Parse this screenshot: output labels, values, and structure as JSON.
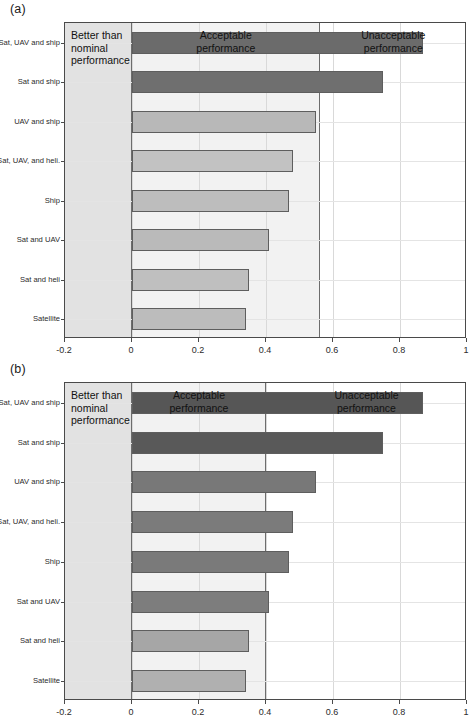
{
  "figure": {
    "panel_a_tag": "(a)",
    "panel_b_tag": "(b)"
  },
  "chart_data": [
    {
      "id": "a",
      "type": "bar",
      "orientation": "horizontal",
      "title": "",
      "xlabel": "",
      "ylabel": "",
      "xlim": [
        -0.2,
        1.0
      ],
      "ylim": [
        0,
        8
      ],
      "grid": true,
      "legend": null,
      "xticks": [
        "-0.2",
        "0",
        "0.2",
        "0.4",
        "0.6",
        "0.8",
        "1"
      ],
      "xtick_values": [
        -0.2,
        0,
        0.2,
        0.4,
        0.6,
        0.8,
        1
      ],
      "categories": [
        "Sat, UAV and ship",
        "Sat and ship",
        "UAV and ship",
        "Sat, UAV, and heli.",
        "Ship",
        "Sat and UAV",
        "Sat and heli",
        "Satellite"
      ],
      "values": [
        0.87,
        0.75,
        0.55,
        0.48,
        0.47,
        0.41,
        0.35,
        0.34
      ],
      "bar_colors": [
        "#6b6b6b",
        "#6f6f6f",
        "#b8b8b8",
        "#c2c2c2",
        "#bdbdbd",
        "#bababa",
        "#bfbfbf",
        "#bcbcbc"
      ],
      "regions": [
        {
          "name": "better",
          "label": "Better than\nnominal\nperformance",
          "from": -0.2,
          "to": 0.0,
          "color": "#e2e2e2"
        },
        {
          "name": "acceptable",
          "label": "Acceptable\nperformance",
          "from": 0.0,
          "to": 0.56,
          "color": "#f2f2f2"
        },
        {
          "name": "unacceptable",
          "label": "Unacceptable\nperformance",
          "from": 0.56,
          "to": 1.0,
          "color": "#ffffff"
        }
      ],
      "threshold": 0.56
    },
    {
      "id": "b",
      "type": "bar",
      "orientation": "horizontal",
      "title": "",
      "xlabel": "",
      "ylabel": "",
      "xlim": [
        -0.2,
        1.0
      ],
      "ylim": [
        0,
        8
      ],
      "grid": true,
      "legend": null,
      "xticks": [
        "-0.2",
        "0",
        "0.2",
        "0.4",
        "0.6",
        "0.8",
        "1"
      ],
      "xtick_values": [
        -0.2,
        0,
        0.2,
        0.4,
        0.6,
        0.8,
        1
      ],
      "categories": [
        "Sat, UAV and ship",
        "Sat and ship",
        "UAV and ship",
        "Sat, UAV, and heli.",
        "Ship",
        "Sat and UAV",
        "Sat and heli",
        "Satellite"
      ],
      "values": [
        0.87,
        0.75,
        0.55,
        0.48,
        0.47,
        0.41,
        0.35,
        0.34
      ],
      "bar_colors": [
        "#565656",
        "#595959",
        "#787878",
        "#7b7b7b",
        "#7a7a7a",
        "#7d7d7d",
        "#a6a6a6",
        "#b0b0b0"
      ],
      "regions": [
        {
          "name": "better",
          "label": "Better than\nnominal\nperformance",
          "from": -0.2,
          "to": 0.0,
          "color": "#e2e2e2"
        },
        {
          "name": "acceptable",
          "label": "Acceptable\nperformance",
          "from": 0.0,
          "to": 0.4,
          "color": "#f2f2f2"
        },
        {
          "name": "unacceptable",
          "label": "Unacceptable\nperformance",
          "from": 0.4,
          "to": 1.0,
          "color": "#ffffff"
        }
      ],
      "threshold": 0.4
    }
  ]
}
